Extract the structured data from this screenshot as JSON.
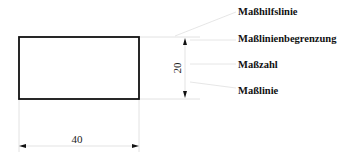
{
  "diagram": {
    "type": "technical-dimensioning",
    "rectangle": {
      "x": 19,
      "y": 37,
      "width": 120,
      "height": 62,
      "stroke": "#111111"
    },
    "dimensions": {
      "horizontal": {
        "value": "40"
      },
      "vertical": {
        "value": "20"
      }
    },
    "labels": [
      {
        "id": "masshilfslinie",
        "text": "Maßhilfslinie"
      },
      {
        "id": "masslinienbegrenzung",
        "text": "Maßlinienbegrenzung"
      },
      {
        "id": "masszahl",
        "text": "Maßzahl"
      },
      {
        "id": "masslinie",
        "text": "Maßlinie"
      }
    ],
    "colors": {
      "outline": "#111111",
      "helper_lines": "#d8d8d8",
      "arrows": "#111111",
      "text": "#111111"
    }
  }
}
